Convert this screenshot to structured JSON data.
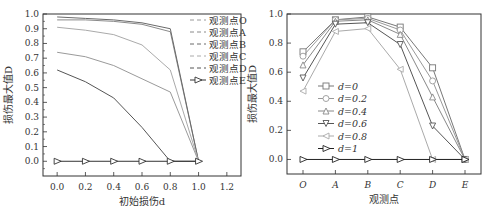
{
  "chart_data": [
    {
      "type": "line",
      "title": "",
      "xlabel": "初始损伤d",
      "ylabel": "损伤最大值D",
      "xlim": [
        -0.1,
        1.3
      ],
      "ylim": [
        -0.1,
        1.0
      ],
      "xticks": [
        "0.0",
        "0.2",
        "0.4",
        "0.6",
        "0.8",
        "1.0",
        "1.2"
      ],
      "yticks": [
        "0.0",
        "0.1",
        "0.2",
        "0.3",
        "0.4",
        "0.5",
        "0.6",
        "0.7",
        "0.8",
        "0.9",
        "1.0"
      ],
      "x": [
        0.0,
        0.2,
        0.4,
        0.6,
        0.8,
        1.0
      ],
      "legend_position": "upper right",
      "series": [
        {
          "name": "观测点O",
          "values": [
            0.74,
            0.71,
            0.65,
            0.56,
            0.47,
            0.0
          ],
          "style": "dashed"
        },
        {
          "name": "观测点A",
          "values": [
            0.96,
            0.96,
            0.95,
            0.93,
            0.88,
            0.0
          ],
          "style": "dashed"
        },
        {
          "name": "观测点B",
          "values": [
            0.98,
            0.97,
            0.96,
            0.94,
            0.9,
            0.0
          ],
          "style": "dashed"
        },
        {
          "name": "观测点C",
          "values": [
            0.91,
            0.89,
            0.86,
            0.79,
            0.62,
            0.0
          ],
          "style": "dashed"
        },
        {
          "name": "观测点D",
          "values": [
            0.62,
            0.54,
            0.43,
            0.23,
            0.0,
            0.0
          ],
          "style": "dashed"
        },
        {
          "name": "观测点E",
          "values": [
            0.0,
            0.0,
            0.0,
            0.0,
            0.0,
            0.0
          ],
          "style": "solid-triangle"
        }
      ]
    },
    {
      "type": "line",
      "title": "",
      "xlabel": "观测点",
      "ylabel": "损伤最大值D",
      "ylim": [
        -0.1,
        1.0
      ],
      "yticks": [
        "0.0",
        "0.2",
        "0.4",
        "0.6",
        "0.8",
        "1.0"
      ],
      "categories": [
        "O",
        "A",
        "B",
        "C",
        "D",
        "E"
      ],
      "legend_position": "center left",
      "series": [
        {
          "name": "d=0",
          "values": [
            0.74,
            0.96,
            0.98,
            0.91,
            0.63,
            0.0
          ],
          "marker": "square"
        },
        {
          "name": "d=0.2",
          "values": [
            0.71,
            0.96,
            0.97,
            0.89,
            0.54,
            0.0
          ],
          "marker": "circle"
        },
        {
          "name": "d=0.4",
          "values": [
            0.65,
            0.95,
            0.96,
            0.86,
            0.43,
            0.0
          ],
          "marker": "triangle-up"
        },
        {
          "name": "d=0.6",
          "values": [
            0.56,
            0.93,
            0.94,
            0.79,
            0.23,
            0.0
          ],
          "marker": "triangle-down"
        },
        {
          "name": "d=0.8",
          "values": [
            0.47,
            0.88,
            0.9,
            0.62,
            0.0,
            0.0
          ],
          "marker": "triangle-left"
        },
        {
          "name": "d=1",
          "values": [
            0.0,
            0.0,
            0.0,
            0.0,
            0.0,
            0.0
          ],
          "marker": "triangle-right"
        }
      ]
    }
  ],
  "colors": {
    "axis": "#333333",
    "series_left": [
      "#9a9a9a",
      "#8a8a8a",
      "#6a6a6a",
      "#aaaaaa",
      "#555555",
      "#333333"
    ],
    "series_right": [
      "#777777",
      "#999999",
      "#888888",
      "#555555",
      "#aaaaaa",
      "#222222"
    ]
  }
}
